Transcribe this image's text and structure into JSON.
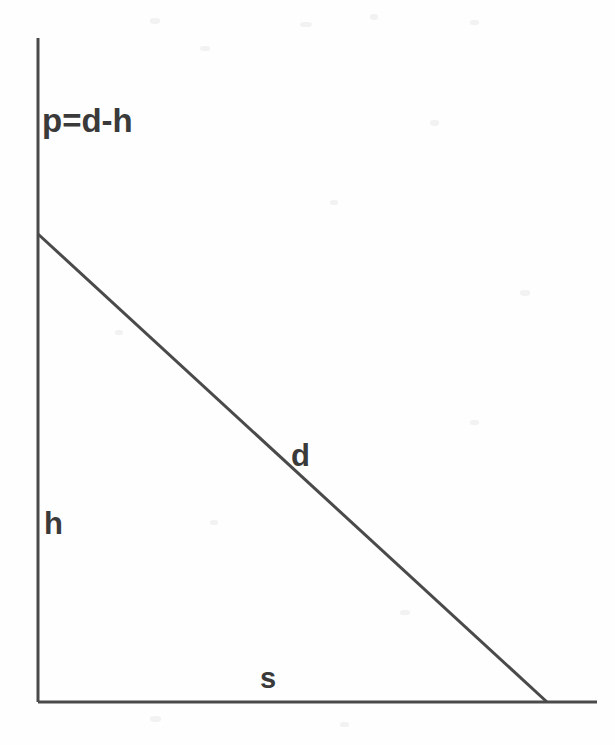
{
  "figure": {
    "type": "geometric-diagram",
    "background_color": "#fefefe",
    "line_color": "#4a4a4a",
    "text_color": "#3a3a3a",
    "line_width": 3
  },
  "labels": {
    "relation": "p=d-h",
    "hypotenuse": "d",
    "height": "h",
    "base": "s"
  },
  "geometry": {
    "vertical_axis": {
      "x1": 38,
      "y1": 38,
      "x2": 38,
      "y2": 702
    },
    "horizontal_axis": {
      "x1": 38,
      "y1": 702,
      "x2": 597,
      "y2": 702
    },
    "hypotenuse": {
      "x1": 38,
      "y1": 234,
      "x2": 547,
      "y2": 702
    }
  },
  "chart_data": {
    "type": "line",
    "title": "",
    "xlabel": "s",
    "ylabel": "h",
    "annotations": [
      "p=d-h",
      "d",
      "h",
      "s"
    ],
    "series": [
      {
        "name": "d",
        "x": [
          38,
          547
        ],
        "y": [
          234,
          702
        ]
      }
    ],
    "axes": {
      "vertical": {
        "from": [
          38,
          702
        ],
        "to": [
          38,
          38
        ]
      },
      "horizontal": {
        "from": [
          38,
          702
        ],
        "to": [
          597,
          702
        ]
      }
    },
    "grid": false,
    "legend": "none"
  }
}
